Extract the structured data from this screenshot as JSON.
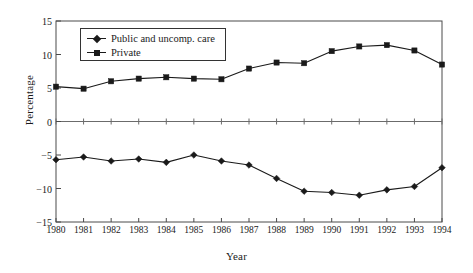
{
  "chart_data": {
    "type": "line",
    "title": "",
    "subtitle": "",
    "xlabel": "Year",
    "ylabel": "Percentage",
    "categories": [
      "1980",
      "1981",
      "1982",
      "1983",
      "1984",
      "1985",
      "1986",
      "1987",
      "1988",
      "1989",
      "1990",
      "1991",
      "1992",
      "1993",
      "1994"
    ],
    "x": [
      1980,
      1981,
      1982,
      1983,
      1984,
      1985,
      1986,
      1987,
      1988,
      1989,
      1990,
      1991,
      1992,
      1993,
      1994
    ],
    "xlim": [
      1980,
      1994
    ],
    "ylim": [
      -15,
      15
    ],
    "yticks": [
      -15,
      -10,
      -5,
      0,
      5,
      10,
      15
    ],
    "ytick_labels": [
      "−15",
      "−10",
      "−5",
      "0",
      "5",
      "10",
      "15"
    ],
    "grid": false,
    "zero_line": true,
    "legend_position": "upper-left-inside",
    "series": [
      {
        "name": "Public and uncomp. care",
        "marker": "diamond",
        "color": "#1a1a1a",
        "values": [
          -5.7,
          -5.3,
          -5.9,
          -5.6,
          -6.1,
          -5.0,
          -5.9,
          -6.5,
          -8.5,
          -10.4,
          -10.6,
          -11.0,
          -10.2,
          -9.7,
          -6.9
        ]
      },
      {
        "name": "Private",
        "marker": "square",
        "color": "#1a1a1a",
        "values": [
          5.2,
          4.9,
          6.0,
          6.4,
          6.6,
          6.4,
          6.3,
          7.9,
          8.8,
          8.7,
          10.5,
          11.2,
          11.4,
          10.6,
          8.5
        ]
      }
    ]
  },
  "legend": {
    "items": [
      {
        "label": "Public and uncomp. care"
      },
      {
        "label": "Private"
      }
    ]
  }
}
